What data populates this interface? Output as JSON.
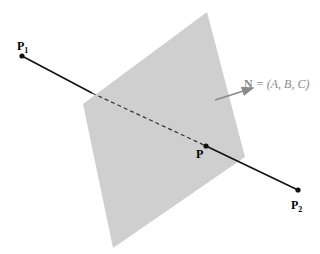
{
  "diagram": {
    "plane_color": "#cfcfcf",
    "line_color": "#111111",
    "normal_color": "#8a8a8a",
    "points": {
      "p1": {
        "label": "P",
        "sub": "1"
      },
      "p": {
        "label": "P"
      },
      "p2": {
        "label": "P",
        "sub": "2"
      }
    },
    "normal_label": {
      "bold": "N",
      "rest": " = (A, B, C)"
    }
  }
}
